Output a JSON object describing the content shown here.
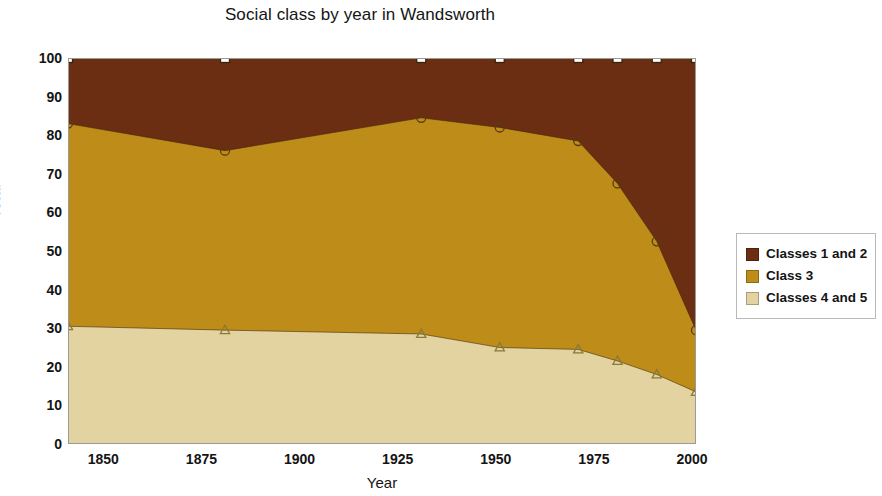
{
  "chart_data": {
    "type": "area",
    "title": "Social class by year in Wandsworth",
    "xlabel": "Year",
    "ylabel": "Total",
    "xlim": [
      1841,
      2001
    ],
    "ylim": [
      0,
      100
    ],
    "xticks": [
      1850,
      1875,
      1900,
      1925,
      1950,
      1975,
      2000
    ],
    "yticks": [
      0,
      10,
      20,
      30,
      40,
      50,
      60,
      70,
      80,
      90,
      100
    ],
    "grid": true,
    "stacked": true,
    "legend_position": "right",
    "x": [
      1841,
      1881,
      1931,
      1951,
      1971,
      1981,
      1991,
      2001
    ],
    "series": [
      {
        "name": "Classes 4 and 5",
        "color": "#E2D3A0",
        "marker": "triangle",
        "values": [
          30.5,
          29.5,
          28.5,
          25.0,
          24.5,
          21.5,
          18.0,
          13.5
        ],
        "cumulative": [
          30.5,
          29.5,
          28.5,
          25.0,
          24.5,
          21.5,
          18.0,
          13.5
        ]
      },
      {
        "name": "Class 3",
        "color": "#BD8C19",
        "marker": "circle",
        "values": [
          52.5,
          46.5,
          56.0,
          57.0,
          54.0,
          46.0,
          34.5,
          16.0
        ],
        "cumulative": [
          83.0,
          76.0,
          84.5,
          82.0,
          78.5,
          67.5,
          52.5,
          29.5
        ]
      },
      {
        "name": "Classes 1 and 2",
        "color": "#6B2E13",
        "marker": "square",
        "values": [
          17.0,
          24.0,
          15.5,
          18.0,
          21.5,
          32.5,
          47.5,
          70.5
        ],
        "cumulative": [
          100,
          100,
          100,
          100,
          100,
          100,
          100,
          100
        ]
      }
    ]
  },
  "legend": {
    "items": [
      {
        "label": "Classes 1 and 2",
        "color": "#6B2E13"
      },
      {
        "label": "Class 3",
        "color": "#BD8C19"
      },
      {
        "label": "Classes 4 and 5",
        "color": "#E2D3A0"
      }
    ]
  }
}
